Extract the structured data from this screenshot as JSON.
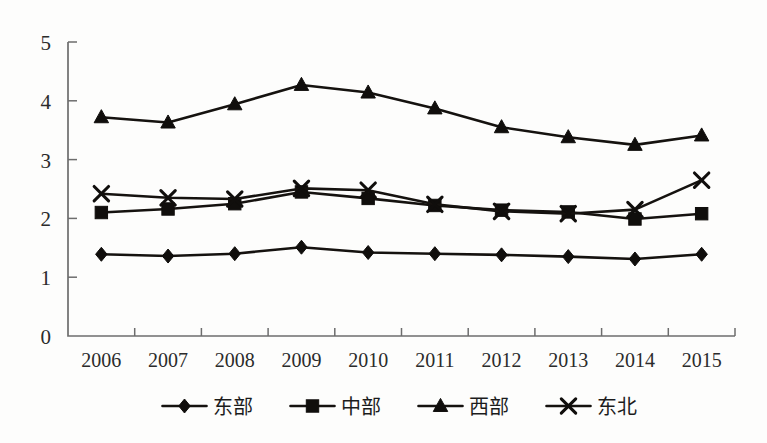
{
  "chart_data": {
    "type": "line",
    "title": "",
    "subtitle": "",
    "xlabel": "",
    "ylabel": "",
    "categories": [
      "2006",
      "2007",
      "2008",
      "2009",
      "2010",
      "2011",
      "2012",
      "2013",
      "2014",
      "2015"
    ],
    "ylim": [
      0,
      5
    ],
    "yticks": [
      "0",
      "1",
      "2",
      "3",
      "4",
      "5"
    ],
    "grid": false,
    "legend_position": "bottom",
    "series": [
      {
        "name": "东部",
        "marker": "diamond",
        "values": [
          1.39,
          1.36,
          1.4,
          1.51,
          1.42,
          1.4,
          1.38,
          1.35,
          1.31,
          1.39
        ]
      },
      {
        "name": "中部",
        "marker": "square",
        "values": [
          2.1,
          2.16,
          2.25,
          2.45,
          2.34,
          2.22,
          2.14,
          2.11,
          1.99,
          2.08
        ]
      },
      {
        "name": "西部",
        "marker": "triangle",
        "values": [
          3.72,
          3.63,
          3.94,
          4.27,
          4.14,
          3.87,
          3.55,
          3.38,
          3.25,
          3.41
        ]
      },
      {
        "name": "东北",
        "marker": "cross-x",
        "values": [
          2.42,
          2.35,
          2.33,
          2.51,
          2.48,
          2.24,
          2.12,
          2.08,
          2.15,
          2.65
        ]
      }
    ]
  },
  "legend": {
    "items": [
      {
        "label": "东部",
        "marker": "diamond"
      },
      {
        "label": "中部",
        "marker": "square"
      },
      {
        "label": "西部",
        "marker": "triangle"
      },
      {
        "label": "东北",
        "marker": "cross-x"
      }
    ]
  },
  "colors": {
    "line": "#15120f",
    "marker": "#100e0c",
    "axis": "#6d6d6d",
    "text": "#2b2b2b",
    "background": "#fdfdfc"
  }
}
